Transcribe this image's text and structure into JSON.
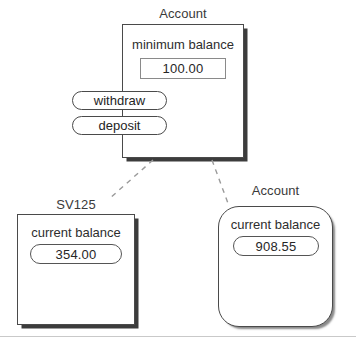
{
  "diagram": {
    "nodes": {
      "parent": {
        "title": "Account",
        "attribute_label": "minimum balance",
        "value": "100.00",
        "operations": [
          {
            "label": "withdraw"
          },
          {
            "label": "deposit"
          }
        ]
      },
      "child_left": {
        "title": "SV125",
        "attribute_label": "current balance",
        "value": "354.00"
      },
      "child_right": {
        "title": "Account",
        "attribute_label": "current balance",
        "value": "908.55"
      }
    },
    "colors": {
      "stroke": "#4a4a4a",
      "field_stroke": "#8a8a8a",
      "text": "#2e2e2e",
      "connector": "#9a9a9a",
      "rule": "#c9c9c9"
    }
  }
}
